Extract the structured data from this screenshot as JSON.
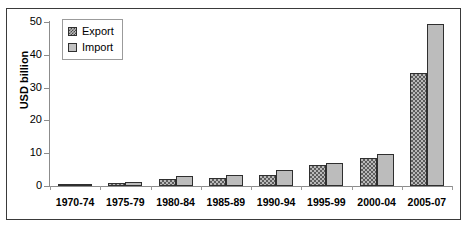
{
  "chart_data": {
    "type": "bar",
    "title": "",
    "xlabel": "",
    "ylabel": "USD billion",
    "ylim": [
      0,
      50
    ],
    "yticks": [
      0,
      10,
      20,
      30,
      40,
      50
    ],
    "grid": false,
    "legend_position": "top-left-inside",
    "categories": [
      "1970-74",
      "1975-79",
      "1980-84",
      "1985-89",
      "1990-94",
      "1995-99",
      "2000-04",
      "2005-07"
    ],
    "series": [
      {
        "name": "Export",
        "values": [
          0.4,
          0.8,
          2.0,
          2.3,
          3.5,
          6.3,
          8.5,
          34.5
        ]
      },
      {
        "name": "Import",
        "values": [
          0.4,
          1.3,
          3.0,
          3.3,
          4.8,
          7.0,
          9.8,
          49.5
        ]
      }
    ]
  },
  "legend": {
    "items": [
      {
        "label": "Export",
        "swatch": "hatched-swatch-icon"
      },
      {
        "label": "Import",
        "swatch": "solid-gray-swatch-icon"
      }
    ]
  },
  "colors": {
    "export_fill": "#b9b9b9",
    "export_hatch": "#5d5d5d",
    "import_fill": "#bcbcbc",
    "bar_outline": "#2f2f2f",
    "axis": "#8c8c8c",
    "frame": "#3a3a3a",
    "text": "#000000"
  }
}
